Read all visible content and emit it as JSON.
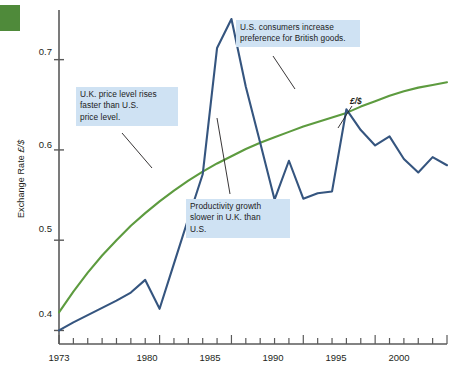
{
  "figure": {
    "corner_color": "#4f8a3a",
    "series_label": "£/$"
  },
  "axes": {
    "y_title_pre": "Exchange Rate ",
    "y_title_sym": "£/$",
    "y_ticks": [
      "0.7",
      "0.6",
      "0.5",
      "0.4"
    ],
    "x_ticks": [
      "1973",
      "1980",
      "1985",
      "1990",
      "1995",
      "2000"
    ]
  },
  "annotations": [
    {
      "id": "uk-price-level",
      "line1": "U.K. price level rises",
      "line2": "faster than U.S.",
      "line3": "price level."
    },
    {
      "id": "us-consumers",
      "line1": "U.S. consumers increase",
      "line2": "preference for British goods.",
      "line3": ""
    },
    {
      "id": "productivity-growth",
      "line1": "Productivity growth",
      "line2": "slower in U.K. than",
      "line3": "U.S."
    }
  ],
  "chart_data": {
    "type": "line",
    "title": "",
    "xlabel": "",
    "ylabel": "Exchange Rate £/$",
    "xlim": [
      1973,
      2000
    ],
    "ylim": [
      0.385,
      0.755
    ],
    "grid": false,
    "legend": "inline-label",
    "x_tick_labels": [
      "1973",
      "1980",
      "1985",
      "1990",
      "1995",
      "2000"
    ],
    "y_tick_labels": [
      "0.4",
      "0.5",
      "0.6",
      "0.7"
    ],
    "y_tick_values": [
      0.4,
      0.5,
      0.6,
      0.7
    ],
    "x_minor_tick_interval": 1,
    "series": [
      {
        "name": "£/$ exchange rate",
        "color": "#35557f",
        "x": [
          1973,
          1974,
          1975,
          1976,
          1977,
          1978,
          1979,
          1980,
          1981,
          1982,
          1983,
          1984,
          1985,
          1986,
          1987,
          1988,
          1989,
          1990,
          1991,
          1992,
          1993,
          1994,
          1995,
          1996,
          1997,
          1998,
          1999,
          2000
        ],
        "values": [
          0.4,
          0.409,
          0.417,
          0.425,
          0.433,
          0.442,
          0.456,
          0.424,
          0.474,
          0.524,
          0.573,
          0.713,
          0.745,
          0.67,
          0.608,
          0.545,
          0.588,
          0.546,
          0.552,
          0.554,
          0.645,
          0.622,
          0.605,
          0.615,
          0.59,
          0.575,
          0.592,
          0.583
        ]
      },
      {
        "name": "Purchasing power parity trend",
        "color": "#5d9b3f",
        "x": [
          1973,
          1974,
          1975,
          1976,
          1977,
          1978,
          1979,
          1980,
          1981,
          1982,
          1983,
          1984,
          1985,
          1986,
          1987,
          1988,
          1989,
          1990,
          1991,
          1992,
          1993,
          1994,
          1995,
          1996,
          1997,
          1998,
          1999,
          2000
        ],
        "values": [
          0.42,
          0.443,
          0.464,
          0.483,
          0.5,
          0.516,
          0.53,
          0.543,
          0.555,
          0.566,
          0.576,
          0.585,
          0.593,
          0.601,
          0.608,
          0.614,
          0.62,
          0.626,
          0.631,
          0.636,
          0.641,
          0.648,
          0.654,
          0.66,
          0.665,
          0.669,
          0.672,
          0.675
        ]
      }
    ],
    "annotations": [
      {
        "text": "U.K. price level rises faster than U.S. price level.",
        "points_to_series": "Purchasing power parity trend"
      },
      {
        "text": "U.S. consumers increase preference for British goods.",
        "points_to_series": "Purchasing power parity trend"
      },
      {
        "text": "Productivity growth slower in U.K. than U.S.",
        "points_to_series": "Purchasing power parity trend"
      },
      {
        "text": "£/$",
        "points_to_series": "£/$ exchange rate"
      }
    ]
  }
}
